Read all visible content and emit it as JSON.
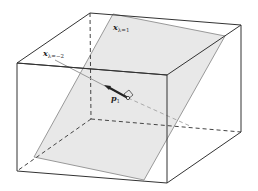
{
  "diagram": {
    "type": "3d-box-with-plane",
    "colors": {
      "edge": "#333333",
      "hidden_edge": "#444444",
      "plane_fill": "#e8e8e8",
      "plane_edge": "#999999",
      "arrow": "#222222"
    },
    "labels": {
      "plane_label": {
        "main": "x",
        "sub": "λ=1"
      },
      "ray_label": {
        "main": "x",
        "sub": "λ=−2"
      },
      "vector_label": {
        "main": "p",
        "sub": "1"
      }
    }
  }
}
